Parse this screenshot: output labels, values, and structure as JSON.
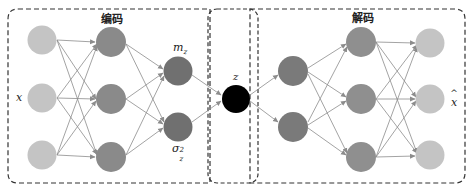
{
  "diagram": {
    "type": "variational-autoencoder",
    "encoder": {
      "title": "编码",
      "input_label": "x",
      "layers": [
        {
          "name": "input",
          "nodes": 3,
          "color": "#c4c4c4"
        },
        {
          "name": "hidden",
          "nodes": 3,
          "color": "#8a8a8a"
        },
        {
          "name": "latent-params",
          "nodes": 2,
          "color": "#707070"
        }
      ],
      "mean_label": "m",
      "mean_sub": "z",
      "variance_label": "σ",
      "variance_sub": "z",
      "variance_sup": "2"
    },
    "latent": {
      "label": "z",
      "color": "#000000"
    },
    "decoder": {
      "title": "解码",
      "output_label": "x̂",
      "output_base": "x",
      "output_hat": "^",
      "layers": [
        {
          "name": "hidden-1",
          "nodes": 2,
          "color": "#7a7a7a"
        },
        {
          "name": "hidden-2",
          "nodes": 3,
          "color": "#8f8f8f"
        },
        {
          "name": "output",
          "nodes": 3,
          "color": "#c4c4c4"
        }
      ]
    },
    "colors": {
      "edge": "#8c8c8c",
      "border": "#333333"
    }
  }
}
